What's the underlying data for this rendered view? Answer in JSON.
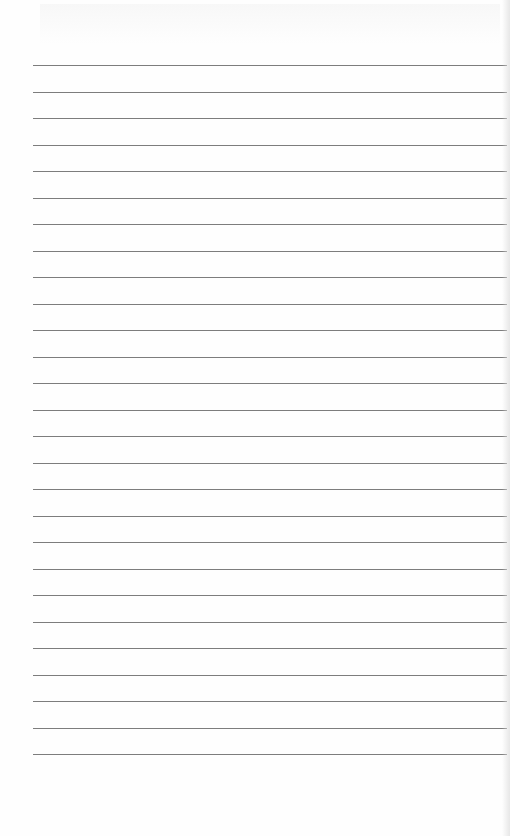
{
  "document": {
    "type": "lined-paper",
    "background_color": "#fefefe",
    "rule_color": "#7d7d7d",
    "rule_count": 27,
    "first_rule_y": 65,
    "rule_spacing": 26.5,
    "rule_left": 33,
    "rule_width": 474
  }
}
